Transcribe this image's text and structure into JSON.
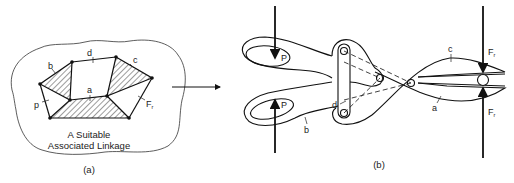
{
  "figure": {
    "panel_a": {
      "caption_line1": "A Suitable",
      "caption_line2": "Associated Linkage",
      "label": "(a)",
      "links": {
        "a": "a",
        "b": "b",
        "c": "c",
        "d": "d",
        "p": "p",
        "fr": "F",
        "fr_sub": "r"
      }
    },
    "arrow": {
      "direction": "right"
    },
    "panel_b": {
      "label": "(b)",
      "forces": {
        "p_top": "P",
        "p_bottom": "P",
        "fr_top": "F",
        "fr_top_sub": "r",
        "fr_bottom": "F",
        "fr_bottom_sub": "r"
      },
      "links": {
        "a": "a",
        "b": "b",
        "c": "c",
        "d": "d"
      }
    }
  },
  "colors": {
    "ink": "#1a1a1a",
    "background": "#ffffff"
  }
}
